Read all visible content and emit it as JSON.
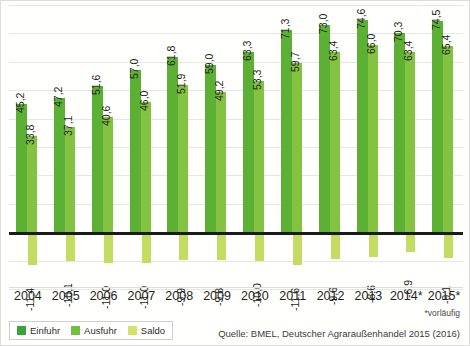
{
  "chart_data": {
    "type": "bar",
    "title": "",
    "subtitle": "",
    "xlabel": "",
    "ylabel": "",
    "grid": true,
    "legend_position": "bottom-left",
    "categories": [
      "2004",
      "2005",
      "2006",
      "2007",
      "2008",
      "2009",
      "2010",
      "2011",
      "2012",
      "2013",
      "2014*",
      "2015*"
    ],
    "ylim": [
      -20,
      80
    ],
    "gridline_step": 10,
    "series": [
      {
        "name": "Einfuhr",
        "color": "#5cb135",
        "values": [
          45.2,
          47.2,
          51.6,
          57.0,
          61.8,
          59.0,
          63.3,
          71.3,
          73.0,
          74.6,
          70.3,
          74.5
        ],
        "labels": [
          "45,2",
          "47,2",
          "51,6",
          "57,0",
          "61,8",
          "59,0",
          "63,3",
          "71,3",
          "73,0",
          "74,6",
          "70,3",
          "74,5"
        ]
      },
      {
        "name": "Ausfuhr",
        "color": "#84c341",
        "values": [
          33.8,
          37.1,
          40.6,
          46.0,
          51.9,
          49.2,
          53.3,
          59.7,
          63.4,
          66.0,
          63.4,
          65.4
        ],
        "labels": [
          "33,8",
          "37,1",
          "40,6",
          "46,0",
          "51,9",
          "49,2",
          "53,3",
          "59,7",
          "63,4",
          "66,0",
          "63,4",
          "65,4"
        ]
      },
      {
        "name": "Saldo",
        "color": "#c3dd63",
        "values": [
          -11.4,
          -10.1,
          -11.0,
          -11.0,
          -9.9,
          -9.8,
          -10.0,
          -11.6,
          -9.6,
          -8.6,
          -6.9,
          -9.1
        ],
        "labels": [
          "-11,4",
          "-10,1",
          "-11,0",
          "-11,0",
          "-9,9",
          "-9,8",
          "-10,0",
          "-11,6",
          "-9,6",
          "-8,6",
          "-6,9",
          "-9,1"
        ]
      }
    ]
  },
  "legend": {
    "items": [
      {
        "label": "Einfuhr",
        "color": "#3aa33a"
      },
      {
        "label": "Ausfuhr",
        "color": "#72bf44"
      },
      {
        "label": "Saldo",
        "color": "#d2e36a"
      }
    ]
  },
  "footnote": "*vorläufig",
  "source": "Quelle: BMEL, Deutscher Agraraußenhandel 2015 (2016)"
}
